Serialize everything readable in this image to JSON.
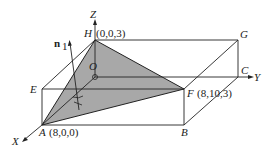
{
  "diagram": {
    "type": "3d-geometry",
    "colors": {
      "line": "#222222",
      "shade": "#a8a8a8",
      "background": "#ffffff"
    },
    "axes": {
      "x": "X",
      "y": "Y",
      "z": "Z"
    },
    "origin": "O",
    "vertices": {
      "H": "H",
      "G": "G",
      "C": "C",
      "E": "E",
      "F": "F",
      "A": "A",
      "B": "B"
    },
    "coordinates": {
      "H": "(0,0,3)",
      "F": "(8,10,3)",
      "A": "(8,0,0)"
    },
    "normal_vector": {
      "label": "n",
      "subscript": "1"
    },
    "shaded_face": [
      "A",
      "H",
      "F"
    ]
  }
}
